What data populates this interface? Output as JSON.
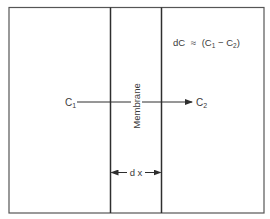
{
  "diagram": {
    "type": "membrane-diffusion-schematic",
    "equation": {
      "lhs": "dC",
      "relation": "≈",
      "rhs_open": "(C",
      "rhs_sub1": "1",
      "rhs_minus": " − C",
      "rhs_sub2": "2",
      "rhs_close": ")"
    },
    "left_concentration": {
      "symbol": "C",
      "subscript": "1"
    },
    "right_concentration": {
      "symbol": "C",
      "subscript": "2"
    },
    "membrane_label": "Membrane",
    "thickness_label": "d x",
    "arrow_direction": "left-to-right",
    "colors": {
      "line": "#2e2e2e",
      "frame": "#555555",
      "text": "#3a3a3a"
    }
  }
}
